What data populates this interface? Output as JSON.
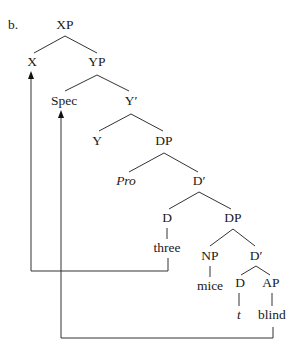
{
  "diagram": {
    "example_label": "b.",
    "type": "syntax-tree",
    "nodes": [
      {
        "id": "XP",
        "label": "XP",
        "x": 65,
        "y": 29,
        "italic": false
      },
      {
        "id": "X",
        "label": "X",
        "x": 32,
        "y": 66,
        "italic": false
      },
      {
        "id": "YP",
        "label": "YP",
        "x": 97,
        "y": 66,
        "italic": false
      },
      {
        "id": "Spec",
        "label": "Spec",
        "x": 64,
        "y": 105,
        "italic": false
      },
      {
        "id": "Ybar",
        "label": "Y′",
        "x": 131,
        "y": 105,
        "italic": false
      },
      {
        "id": "Y",
        "label": "Y",
        "x": 97,
        "y": 145,
        "italic": false
      },
      {
        "id": "DP1",
        "label": "DP",
        "x": 164,
        "y": 145,
        "italic": false
      },
      {
        "id": "Pro",
        "label": "Pro",
        "x": 126,
        "y": 185,
        "italic": true
      },
      {
        "id": "Dbar1",
        "label": "D′",
        "x": 199,
        "y": 185,
        "italic": false
      },
      {
        "id": "D1",
        "label": "D",
        "x": 167,
        "y": 222,
        "italic": false
      },
      {
        "id": "DP2",
        "label": "DP",
        "x": 233,
        "y": 222,
        "italic": false
      },
      {
        "id": "three",
        "label": "three",
        "x": 167,
        "y": 252,
        "italic": false
      },
      {
        "id": "NP",
        "label": "NP",
        "x": 210,
        "y": 260,
        "italic": false
      },
      {
        "id": "Dbar2",
        "label": "D′",
        "x": 256,
        "y": 260,
        "italic": false
      },
      {
        "id": "mice",
        "label": "mice",
        "x": 210,
        "y": 290,
        "italic": false
      },
      {
        "id": "D2",
        "label": "D",
        "x": 240,
        "y": 287,
        "italic": false
      },
      {
        "id": "AP",
        "label": "AP",
        "x": 271,
        "y": 287,
        "italic": false
      },
      {
        "id": "t",
        "label": "t",
        "x": 239,
        "y": 319,
        "italic": true
      },
      {
        "id": "blind",
        "label": "blind",
        "x": 272,
        "y": 319,
        "italic": false
      }
    ],
    "edges": [
      [
        "XP",
        "X"
      ],
      [
        "XP",
        "YP"
      ],
      [
        "YP",
        "Spec"
      ],
      [
        "YP",
        "Ybar"
      ],
      [
        "Ybar",
        "Y"
      ],
      [
        "Ybar",
        "DP1"
      ],
      [
        "DP1",
        "Pro"
      ],
      [
        "DP1",
        "Dbar1"
      ],
      [
        "Dbar1",
        "D1"
      ],
      [
        "Dbar1",
        "DP2"
      ],
      [
        "D1",
        "three"
      ],
      [
        "DP2",
        "NP"
      ],
      [
        "DP2",
        "Dbar2"
      ],
      [
        "NP",
        "mice"
      ],
      [
        "Dbar2",
        "D2"
      ],
      [
        "Dbar2",
        "AP"
      ],
      [
        "D2",
        "t"
      ],
      [
        "AP",
        "blind"
      ]
    ],
    "movement_arrows": [
      {
        "name": "movement-three-to-X",
        "from": "three",
        "to": "X"
      },
      {
        "name": "movement-blind-to-Spec",
        "from": "blind",
        "to": "Spec"
      }
    ]
  }
}
